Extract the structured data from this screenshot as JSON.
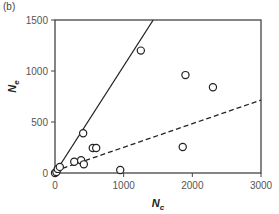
{
  "panel_label": "(b)",
  "chart_data": {
    "type": "scatter",
    "title": "",
    "xlabel": "N_c",
    "ylabel": "N_e",
    "xlabel_main": "N",
    "xlabel_sub": "c",
    "ylabel_main": "N",
    "ylabel_sub": "e",
    "xlim": [
      0,
      3000
    ],
    "ylim": [
      0,
      1500
    ],
    "xticks": [
      0,
      1000,
      2000,
      3000
    ],
    "yticks": [
      0,
      500,
      1000,
      1500
    ],
    "grid": false,
    "legend": null,
    "points": [
      {
        "x": 0,
        "y": 0
      },
      {
        "x": 20,
        "y": 10
      },
      {
        "x": 40,
        "y": 40
      },
      {
        "x": 70,
        "y": 60
      },
      {
        "x": 280,
        "y": 110
      },
      {
        "x": 380,
        "y": 125
      },
      {
        "x": 410,
        "y": 390
      },
      {
        "x": 420,
        "y": 85
      },
      {
        "x": 550,
        "y": 245
      },
      {
        "x": 600,
        "y": 245
      },
      {
        "x": 950,
        "y": 30
      },
      {
        "x": 1250,
        "y": 1200
      },
      {
        "x": 1860,
        "y": 255
      },
      {
        "x": 1900,
        "y": 960
      },
      {
        "x": 2300,
        "y": 840
      }
    ],
    "lines": [
      {
        "name": "solid reference line",
        "style": "solid",
        "x": [
          0,
          1430
        ],
        "y": [
          0,
          1500
        ]
      },
      {
        "name": "dashed fit line",
        "style": "dashed",
        "x": [
          0,
          3000
        ],
        "y": [
          20,
          715
        ]
      }
    ]
  }
}
